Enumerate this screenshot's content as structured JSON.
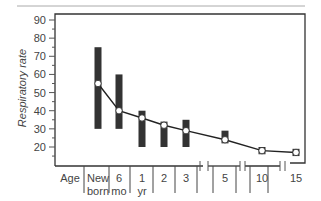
{
  "chart_data": {
    "type": "line",
    "title": "",
    "xlabel": "Age",
    "ylabel": "Respiratory rate",
    "ylim": [
      10,
      92
    ],
    "yticks": [
      20,
      30,
      40,
      50,
      60,
      70,
      80,
      90
    ],
    "grid": false,
    "categories": [
      {
        "line1": "New",
        "line2": "born"
      },
      {
        "line1": "6",
        "line2": "mo"
      },
      {
        "line1": "1",
        "line2": "yr"
      },
      {
        "line1": "2",
        "line2": ""
      },
      {
        "line1": "3",
        "line2": ""
      },
      {
        "line1": "5",
        "line2": ""
      },
      {
        "line1": "10",
        "line2": ""
      },
      {
        "line1": "15",
        "line2": ""
      }
    ],
    "series": [
      {
        "name": "Mean respiratory rate",
        "values": [
          55,
          40,
          36,
          32,
          29,
          24,
          18,
          17
        ]
      },
      {
        "name": "Range low",
        "values": [
          30,
          30,
          20,
          20,
          20,
          22,
          16,
          15
        ]
      },
      {
        "name": "Range high",
        "values": [
          75,
          60,
          40,
          34,
          35,
          29,
          20,
          19
        ]
      }
    ],
    "axis_break_marks": "after 3, after 5, after 10",
    "colors": {
      "bar": "#333333",
      "line": "#222222",
      "point_fill": "#ffffff",
      "axis": "#333333"
    }
  }
}
